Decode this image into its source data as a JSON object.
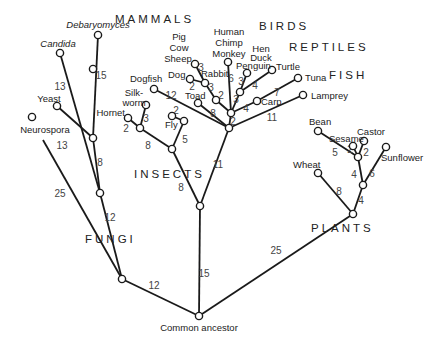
{
  "root_label": "Common ancestor",
  "groups": [
    {
      "label": "MAMMALS",
      "x": 115,
      "y": 23
    },
    {
      "label": "BIRDS",
      "x": 259,
      "y": 30
    },
    {
      "label": "REPTILES",
      "x": 289,
      "y": 51
    },
    {
      "label": "FISH",
      "x": 329,
      "y": 79
    },
    {
      "label": "INSECTS",
      "x": 134,
      "y": 178
    },
    {
      "label": "FUNGI",
      "x": 85,
      "y": 243
    },
    {
      "label": "PLANTS",
      "x": 311,
      "y": 232
    }
  ],
  "nodes": [
    {
      "id": "root",
      "x": 199,
      "y": 316
    },
    {
      "id": "fungi_base",
      "x": 122,
      "y": 279
    },
    {
      "id": "fungi_a",
      "x": 100,
      "y": 193
    },
    {
      "id": "fungi_b",
      "x": 93,
      "y": 138
    },
    {
      "id": "debaryomyces",
      "x": 98,
      "y": 35
    },
    {
      "id": "candida",
      "x": 60,
      "y": 53
    },
    {
      "id": "yeast",
      "x": 57,
      "y": 106
    },
    {
      "id": "neurospora",
      "x": 32,
      "y": 117
    },
    {
      "id": "animal_base",
      "x": 200,
      "y": 206
    },
    {
      "id": "insects",
      "x": 93,
      "y": 69
    },
    {
      "id": "insect_node",
      "x": 172,
      "y": 149
    },
    {
      "id": "hymen_node",
      "x": 140,
      "y": 128
    },
    {
      "id": "hornet",
      "x": 128,
      "y": 118
    },
    {
      "id": "silkworm",
      "x": 146,
      "y": 105
    },
    {
      "id": "fly_node",
      "x": 184,
      "y": 121
    },
    {
      "id": "fly",
      "x": 172,
      "y": 116
    },
    {
      "id": "vert_base",
      "x": 229,
      "y": 128
    },
    {
      "id": "vert_a",
      "x": 231,
      "y": 113
    },
    {
      "id": "dogfish",
      "x": 154,
      "y": 89
    },
    {
      "id": "toad",
      "x": 198,
      "y": 103
    },
    {
      "id": "mammal_node",
      "x": 216,
      "y": 100
    },
    {
      "id": "mammal_upper",
      "x": 205,
      "y": 83
    },
    {
      "id": "sheep",
      "x": 195,
      "y": 64
    },
    {
      "id": "dog",
      "x": 190,
      "y": 79
    },
    {
      "id": "monkey",
      "x": 228,
      "y": 62
    },
    {
      "id": "bird_node",
      "x": 240,
      "y": 92
    },
    {
      "id": "penguin",
      "x": 247,
      "y": 73
    },
    {
      "id": "turtle",
      "x": 272,
      "y": 70
    },
    {
      "id": "carp",
      "x": 257,
      "y": 101
    },
    {
      "id": "tuna",
      "x": 298,
      "y": 78
    },
    {
      "id": "lamprey",
      "x": 303,
      "y": 95
    },
    {
      "id": "plant_base",
      "x": 353,
      "y": 214
    },
    {
      "id": "plant_a",
      "x": 363,
      "y": 185
    },
    {
      "id": "plant_b",
      "x": 358,
      "y": 157
    },
    {
      "id": "bean",
      "x": 318,
      "y": 131
    },
    {
      "id": "sesame",
      "x": 353,
      "y": 146
    },
    {
      "id": "castor",
      "x": 364,
      "y": 141
    },
    {
      "id": "sunflower",
      "x": 386,
      "y": 147
    },
    {
      "id": "wheat",
      "x": 318,
      "y": 173
    }
  ],
  "edges": [
    {
      "from": "root",
      "to": "fungi_base",
      "weight": "12",
      "wx": 154,
      "wy": 289
    },
    {
      "from": "root",
      "to": "animal_base",
      "weight": "15",
      "wx": 204,
      "wy": 277
    },
    {
      "from": "root",
      "to": "plant_base",
      "weight": "25",
      "wx": 276,
      "wy": 254
    },
    {
      "from": "fungi_base",
      "to": "fungi_a",
      "weight": "12",
      "wx": 110,
      "wy": 221
    },
    {
      "from": "fungi_base",
      "to": "neurospora",
      "weight": "25",
      "wx": 60,
      "wy": 197,
      "hidden_end": true,
      "tx": 43,
      "ty": 140
    },
    {
      "from": "fungi_a",
      "to": "fungi_b",
      "weight": "8",
      "wx": 100,
      "wy": 166
    },
    {
      "from": "fungi_a",
      "to": "candida",
      "weight": "13",
      "wx": 60,
      "wy": 90
    },
    {
      "from": "fungi_b",
      "to": "debaryomyces",
      "weight": "15",
      "wx": 101,
      "wy": 79
    },
    {
      "from": "fungi_b",
      "to": "yeast",
      "weight": "13",
      "wx": 62,
      "wy": 149
    },
    {
      "from": "animal_base",
      "to": "insect_node",
      "weight": "8",
      "wx": 181,
      "wy": 191
    },
    {
      "from": "animal_base",
      "to": "vert_base",
      "weight": "11",
      "wx": 218,
      "wy": 168
    },
    {
      "from": "insect_node",
      "to": "hymen_node",
      "weight": "8",
      "wx": 148,
      "wy": 149
    },
    {
      "from": "insect_node",
      "to": "fly_node",
      "weight": "5",
      "wx": 185,
      "wy": 143
    },
    {
      "from": "hymen_node",
      "to": "hornet",
      "weight": "2",
      "wx": 126,
      "wy": 132
    },
    {
      "from": "hymen_node",
      "to": "silkworm",
      "weight": "3",
      "wx": 146,
      "wy": 122
    },
    {
      "from": "fly_node",
      "to": "fly",
      "weight": "2",
      "wx": 176,
      "wy": 114
    },
    {
      "from": "vert_base",
      "to": "vert_a",
      "weight": "2",
      "wx": 233,
      "wy": 125
    },
    {
      "from": "vert_base",
      "to": "dogfish",
      "weight": "12",
      "wx": 171,
      "wy": 99
    },
    {
      "from": "vert_base",
      "to": "toad",
      "weight": "8",
      "wx": 213,
      "wy": 117
    },
    {
      "from": "vert_base",
      "to": "lamprey",
      "weight": "11",
      "wx": 272,
      "wy": 121
    },
    {
      "from": "vert_a",
      "to": "mammal_node",
      "weight": "2",
      "wx": 221,
      "wy": 99
    },
    {
      "from": "vert_a",
      "to": "monkey",
      "weight": "6",
      "wx": 231,
      "wy": 82
    },
    {
      "from": "vert_a",
      "to": "bird_node",
      "weight": "3",
      "wx": 236,
      "wy": 103
    },
    {
      "from": "vert_a",
      "to": "carp",
      "weight": "4",
      "wx": 246,
      "wy": 112
    },
    {
      "from": "carp",
      "to": "tuna",
      "weight": "7",
      "wx": 277,
      "wy": 96
    },
    {
      "from": "mammal_node",
      "to": "mammal_upper",
      "weight": "3",
      "wx": 211,
      "wy": 91
    },
    {
      "from": "mammal_upper",
      "to": "sheep",
      "weight": "3",
      "wx": 201,
      "wy": 71
    },
    {
      "from": "mammal_upper",
      "to": "dog",
      "weight": "2",
      "wx": 192,
      "wy": 90
    },
    {
      "from": "bird_node",
      "to": "penguin",
      "weight": "3",
      "wx": 241,
      "wy": 85
    },
    {
      "from": "bird_node",
      "to": "turtle",
      "weight": "4",
      "wx": 255,
      "wy": 89
    },
    {
      "from": "plant_base",
      "to": "plant_a",
      "weight": "4",
      "wx": 361,
      "wy": 204
    },
    {
      "from": "plant_base",
      "to": "wheat",
      "weight": "8",
      "wx": 339,
      "wy": 195
    },
    {
      "from": "plant_a",
      "to": "plant_b",
      "weight": "4",
      "wx": 354,
      "wy": 178
    },
    {
      "from": "plant_a",
      "to": "sunflower",
      "weight": "6",
      "wx": 372,
      "wy": 177
    },
    {
      "from": "plant_b",
      "to": "bean",
      "weight": "5",
      "wx": 335,
      "wy": 156
    },
    {
      "from": "plant_b",
      "to": "sesame",
      "weight": "2",
      "wx": 350,
      "wy": 153
    },
    {
      "from": "plant_b",
      "to": "castor",
      "weight": "2",
      "wx": 366,
      "wy": 156
    }
  ],
  "taxa": [
    {
      "label": "Debaryomyces",
      "x": 98,
      "y": 28,
      "anchor": "middle",
      "italic": true
    },
    {
      "label": "Candida",
      "x": 58,
      "y": 47,
      "anchor": "middle",
      "italic": true
    },
    {
      "label": "Yeast",
      "x": 49,
      "y": 102,
      "anchor": "middle"
    },
    {
      "label": "Neurospora",
      "x": 45,
      "y": 133,
      "anchor": "middle"
    },
    {
      "label": "Silk-",
      "x": 134,
      "y": 96,
      "anchor": "middle"
    },
    {
      "label": "worm",
      "x": 134,
      "y": 106,
      "anchor": "middle"
    },
    {
      "label": "Hornet",
      "x": 125,
      "y": 116,
      "anchor": "end"
    },
    {
      "label": "Fly",
      "x": 165,
      "y": 128,
      "anchor": "start"
    },
    {
      "label": "Dogfish",
      "x": 130,
      "y": 82,
      "anchor": "start"
    },
    {
      "label": "Toad",
      "x": 185,
      "y": 99,
      "anchor": "start"
    },
    {
      "label": "Dog",
      "x": 168,
      "y": 78,
      "anchor": "start"
    },
    {
      "label": "Rabbit",
      "x": 201,
      "y": 77,
      "anchor": "start"
    },
    {
      "label": "Pig",
      "x": 179,
      "y": 40,
      "anchor": "middle"
    },
    {
      "label": "Cow",
      "x": 179,
      "y": 51,
      "anchor": "middle"
    },
    {
      "label": "Sheep",
      "x": 178,
      "y": 62,
      "anchor": "middle"
    },
    {
      "label": "Human",
      "x": 229,
      "y": 35,
      "anchor": "middle"
    },
    {
      "label": "Chimp",
      "x": 229,
      "y": 46,
      "anchor": "middle"
    },
    {
      "label": "Monkey",
      "x": 229,
      "y": 57,
      "anchor": "middle"
    },
    {
      "label": "Hen",
      "x": 261,
      "y": 52,
      "anchor": "middle"
    },
    {
      "label": "Duck",
      "x": 261,
      "y": 61,
      "anchor": "middle"
    },
    {
      "label": "Penguin",
      "x": 236,
      "y": 69,
      "anchor": "start"
    },
    {
      "label": "Turtle",
      "x": 276,
      "y": 70,
      "anchor": "start"
    },
    {
      "label": "Carp",
      "x": 261,
      "y": 105,
      "anchor": "start"
    },
    {
      "label": "Tuna",
      "x": 305,
      "y": 81,
      "anchor": "start"
    },
    {
      "label": "Lamprey",
      "x": 311,
      "y": 99,
      "anchor": "start"
    },
    {
      "label": "Bean",
      "x": 309,
      "y": 125,
      "anchor": "start"
    },
    {
      "label": "Sesame",
      "x": 329,
      "y": 142,
      "anchor": "start"
    },
    {
      "label": "Castor",
      "x": 357,
      "y": 135,
      "anchor": "start"
    },
    {
      "label": "Sunflower",
      "x": 381,
      "y": 161,
      "anchor": "start"
    },
    {
      "label": "Wheat",
      "x": 293,
      "y": 168,
      "anchor": "start"
    }
  ]
}
